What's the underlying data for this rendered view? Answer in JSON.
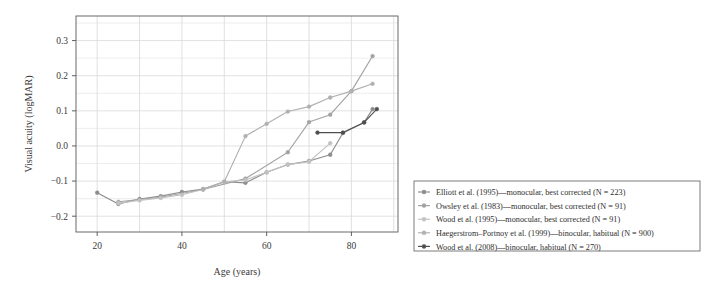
{
  "chart_data": {
    "type": "line",
    "title": "",
    "xlabel": "Age (years)",
    "ylabel": "Visual acuity (logMAR)",
    "xlim": [
      15,
      91
    ],
    "ylim": [
      -0.245,
      0.37
    ],
    "xticks": [
      20,
      40,
      60,
      80
    ],
    "yticks": [
      -0.2,
      -0.1,
      0.0,
      0.1,
      0.2,
      0.3
    ],
    "ytick_labels": [
      "-0.2",
      "-0.1",
      "0.0",
      "0.1",
      "0.2",
      "0.3"
    ],
    "xtick_labels": [
      "20",
      "40",
      "60",
      "80"
    ],
    "grid": true,
    "grid_minor_y": true,
    "legend_position": "right-outside",
    "series": [
      {
        "name": "Elliott et al. (1995)—monocular, best corrected (N = 223)",
        "color": "#8c8c8c",
        "x": [
          20,
          25,
          30,
          35,
          40,
          45,
          50,
          55,
          60,
          65,
          70,
          75,
          78,
          83,
          85
        ],
        "y": [
          -0.133,
          -0.165,
          -0.151,
          -0.143,
          -0.131,
          -0.123,
          -0.102,
          -0.105,
          -0.075,
          -0.053,
          -0.043,
          -0.025,
          0.037,
          0.067,
          0.105
        ]
      },
      {
        "name": "Owsley et al. (1983)—monocular, best corrected (N = 91)",
        "color": "#a3a3a3",
        "x": [
          25,
          35,
          45,
          55,
          65,
          70,
          75,
          80,
          85
        ],
        "y": [
          -0.159,
          -0.146,
          -0.124,
          -0.093,
          -0.018,
          0.068,
          0.089,
          0.156,
          0.256
        ]
      },
      {
        "name": "Wood et al. (1995)—monocular, best corrected (N = 91)",
        "color": "#c2c2c2",
        "x": [
          25,
          30,
          35,
          40,
          45,
          50,
          55,
          60,
          65,
          70,
          75
        ],
        "y": [
          -0.163,
          -0.155,
          -0.148,
          -0.139,
          -0.124,
          -0.102,
          -0.097,
          -0.075,
          -0.053,
          -0.045,
          0.008
        ]
      },
      {
        "name": "Haegerstrom–Portnoy et al. (1999)—binocular, habitual (N = 900)",
        "color": "#b0b0b0",
        "x": [
          45,
          50,
          55,
          60,
          65,
          70,
          75,
          80,
          85
        ],
        "y": [
          -0.123,
          -0.102,
          0.028,
          0.063,
          0.098,
          0.112,
          0.138,
          0.156,
          0.177
        ]
      },
      {
        "name": "Wood et al. (2008)—binocular, habitual (N = 270)",
        "color": "#4f4f4f",
        "x": [
          72,
          78,
          83,
          86
        ],
        "y": [
          0.038,
          0.038,
          0.067,
          0.105
        ]
      }
    ],
    "legend_entries": [
      {
        "label": "Elliott et al. (1995)—monocular, best corrected (N = 223)",
        "color": "#8c8c8c"
      },
      {
        "label": "Owsley et al. (1983)—monocular, best corrected (N = 91)",
        "color": "#a3a3a3"
      },
      {
        "label": "Wood et al. (1995)—monocular, best corrected (N = 91)",
        "color": "#c2c2c2"
      },
      {
        "label": "Haegerstrom–Portnoy et al. (1999)—binocular, habitual (N = 900)",
        "color": "#b0b0b0"
      },
      {
        "label": "Wood et al. (2008)—binocular, habitual (N = 270)",
        "color": "#4f4f4f"
      }
    ],
    "colors": {
      "axis": "#4d4d4d",
      "grid": "#d9d9d9",
      "background": "#ffffff",
      "legend_border": "#6e6e6e",
      "text": "#3a3a3a"
    }
  }
}
